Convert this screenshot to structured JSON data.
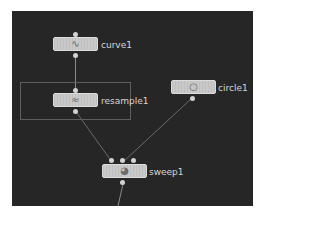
{
  "network": {
    "background_color": "#262626",
    "node_color": "#c9c9c9",
    "wire_color": "#8a8a8a",
    "label_color": "#d6d6d6",
    "nodes": [
      {
        "id": "curve1",
        "label": "curve1",
        "icon": "curve-icon",
        "glyph": "∿"
      },
      {
        "id": "resample1",
        "label": "resample1",
        "icon": "resample-icon",
        "glyph": "≈"
      },
      {
        "id": "circle1",
        "label": "circle1",
        "icon": "circle-icon",
        "glyph": "○"
      },
      {
        "id": "sweep1",
        "label": "sweep1",
        "icon": "sweep-icon",
        "glyph": "◕"
      }
    ],
    "connections": [
      {
        "from": "curve1",
        "to": "resample1"
      },
      {
        "from": "resample1",
        "to": "sweep1"
      },
      {
        "from": "circle1",
        "to": "sweep1"
      }
    ]
  }
}
